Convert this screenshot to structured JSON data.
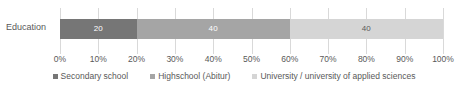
{
  "chart_data": {
    "type": "bar",
    "orientation": "horizontal",
    "stacked": true,
    "normalized_percent": true,
    "title": "",
    "xlabel": "",
    "ylabel": "",
    "categories": [
      "Education"
    ],
    "series": [
      {
        "name": "Secondary school",
        "values": [
          20
        ],
        "color": "#767676",
        "label_color": "#ffffff"
      },
      {
        "name": "Highschool (Abitur)",
        "values": [
          40
        ],
        "color": "#a5a5a5",
        "label_color": "#ffffff"
      },
      {
        "name": "University / university of applied sciences",
        "values": [
          40
        ],
        "color": "#d5d5d5",
        "label_color": "#5a5a5a"
      }
    ],
    "data_labels": [
      "20",
      "40",
      "40"
    ],
    "xlim": [
      0,
      100
    ],
    "xticks": [
      0,
      10,
      20,
      30,
      40,
      50,
      60,
      70,
      80,
      90,
      100
    ],
    "xticklabels": [
      "0%",
      "10%",
      "20%",
      "30%",
      "40%",
      "50%",
      "60%",
      "70%",
      "80%",
      "90%",
      "100%"
    ],
    "grid": true,
    "grid_color": "#d9d9d9",
    "legend_position": "bottom",
    "axis_text_color": "#595959",
    "background": "#ffffff"
  },
  "category_label": "Education",
  "legend": {
    "items": [
      {
        "marker": "legend-swatch-secondary-school",
        "label": "Secondary school"
      },
      {
        "marker": "legend-swatch-highschool",
        "label": "Highschool (Abitur)"
      },
      {
        "marker": "legend-swatch-university",
        "label": "University / university of applied sciences"
      }
    ]
  }
}
